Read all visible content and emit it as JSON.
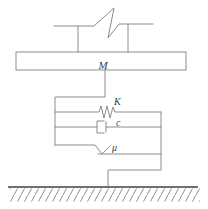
{
  "diagram": {
    "labels": {
      "mass": "M",
      "spring": "K",
      "damper": "c",
      "friction": "μ"
    },
    "colors": {
      "line": "#8c8c8c",
      "ground": "#6f6f6f",
      "label": "#3b3b3b",
      "background": "#ffffff"
    }
  }
}
